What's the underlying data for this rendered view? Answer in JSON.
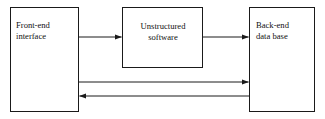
{
  "diagram": {
    "colors": {
      "stroke": "#1a1a1a",
      "background": "#ffffff",
      "text": "#111111"
    },
    "nodes": [
      {
        "id": "front-end",
        "line1": "Front-end",
        "line2": "interface",
        "x": 10,
        "y": 7,
        "width": 69,
        "height": 105,
        "align": "left"
      },
      {
        "id": "unstructured-software",
        "line1": "Unstructured",
        "line2": "software",
        "x": 122,
        "y": 7,
        "width": 81,
        "height": 61,
        "align": "center"
      },
      {
        "id": "back-end",
        "line1": "Back-end",
        "line2": "data base",
        "x": 249,
        "y": 7,
        "width": 66,
        "height": 105,
        "align": "left"
      }
    ],
    "connectors": [
      {
        "id": "front-end-to-software",
        "from": "front-end",
        "to": "unstructured-software",
        "direction": "right",
        "y": 37
      },
      {
        "id": "software-to-back-end",
        "from": "unstructured-software",
        "to": "back-end",
        "direction": "right",
        "y": 37
      },
      {
        "id": "front-end-to-back-end-direct",
        "from": "front-end",
        "to": "back-end",
        "direction": "right",
        "y": 82
      },
      {
        "id": "back-end-to-front-end-return",
        "from": "back-end",
        "to": "front-end",
        "direction": "left",
        "y": 96
      }
    ]
  }
}
